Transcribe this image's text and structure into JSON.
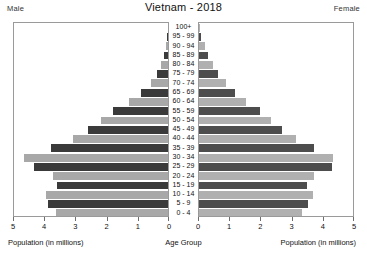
{
  "header": {
    "male_label": "Male",
    "female_label": "Female",
    "title": "Vietnam - 2018"
  },
  "captions": {
    "left": "Population (in millions)",
    "center": "Age Group",
    "right": "Population (in millions)"
  },
  "watermark": "",
  "colors": {
    "male_dark": "#3a3a3a",
    "male_light": "#a8a8a8",
    "female_dark": "#4d4d4d",
    "female_light": "#b0b0b0",
    "frame": "#9a9a9a",
    "background": "#ffffff"
  },
  "chart_data": {
    "type": "bar",
    "subtype": "population-pyramid",
    "title": "Vietnam - 2018",
    "xlabel": "Population (in millions)",
    "ylabel": "Age Group",
    "xlim": [
      0,
      5
    ],
    "left_axis_ticks": [
      5,
      4,
      3,
      2,
      1,
      0
    ],
    "right_axis_ticks": [
      0,
      1,
      2,
      3,
      4,
      5
    ],
    "grid": false,
    "legend": [
      "Male",
      "Female"
    ],
    "categories": [
      "100+",
      "95 - 99",
      "90 - 94",
      "85 - 89",
      "80 - 84",
      "75 - 79",
      "70 - 74",
      "65 - 69",
      "60 - 64",
      "55 - 59",
      "50 - 54",
      "45 - 49",
      "40 - 44",
      "35 - 39",
      "30 - 34",
      "25 - 29",
      "20 - 24",
      "15 - 19",
      "10 - 14",
      "5 - 9",
      "0 - 4"
    ],
    "series": [
      {
        "name": "Male",
        "side": "left",
        "values": [
          0.01,
          0.03,
          0.07,
          0.13,
          0.22,
          0.35,
          0.55,
          0.85,
          1.25,
          1.75,
          2.15,
          2.55,
          3.05,
          3.75,
          4.6,
          4.3,
          3.7,
          3.55,
          3.9,
          3.85,
          3.6
        ]
      },
      {
        "name": "Female",
        "side": "right",
        "values": [
          0.03,
          0.08,
          0.18,
          0.3,
          0.45,
          0.6,
          0.85,
          1.15,
          1.5,
          1.95,
          2.3,
          2.65,
          3.1,
          3.7,
          4.3,
          4.25,
          3.7,
          3.45,
          3.65,
          3.5,
          3.3
        ]
      }
    ]
  }
}
